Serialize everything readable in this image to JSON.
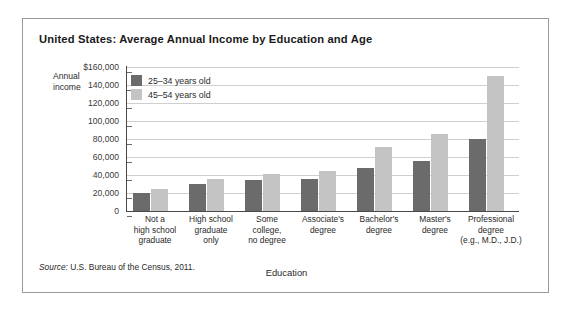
{
  "figure": {
    "title": "United States: Average Annual Income by Education and Age",
    "source_prefix": "Source:",
    "source_text": " U.S. Bureau of the Census, 2011."
  },
  "axis": {
    "y_title_line1": "Annual",
    "y_title_line2": "income",
    "x_title": "Education"
  },
  "colors": {
    "series_young": "#6b6b6b",
    "series_older": "#c4c4c4",
    "gridline": "#cfcfcf",
    "axis": "#4a4a4a",
    "frame": "#9a9a9a"
  },
  "chart_data": {
    "type": "bar",
    "title": "United States: Average Annual Income by Education and Age",
    "xlabel": "Education",
    "ylabel": "Annual income",
    "ylim": [
      0,
      160000
    ],
    "yticks": [
      0,
      20000,
      40000,
      60000,
      80000,
      100000,
      120000,
      140000,
      160000
    ],
    "ytick_labels": [
      "0",
      "20,000",
      "40,000",
      "60,000",
      "80,000",
      "100,000",
      "120,000",
      "140,000",
      "$160,000"
    ],
    "grid": true,
    "legend_position": "upper-left-inside",
    "categories": [
      "Not a\nhigh school\ngraduate",
      "High school\ngraduate\nonly",
      "Some\ncollege,\nno degree",
      "Associate's\ndegree",
      "Bachelor's\ndegree",
      "Master's\ndegree",
      "Professional\ndegree\n(e.g., M.D., J.D.)"
    ],
    "series": [
      {
        "name": "25–34 years old",
        "color": "#6b6b6b",
        "values": [
          20000,
          30000,
          34000,
          36000,
          48000,
          56000,
          80000
        ]
      },
      {
        "name": "45–54 years old",
        "color": "#c4c4c4",
        "values": [
          25000,
          36000,
          41000,
          45000,
          71000,
          86000,
          150000
        ]
      }
    ]
  }
}
